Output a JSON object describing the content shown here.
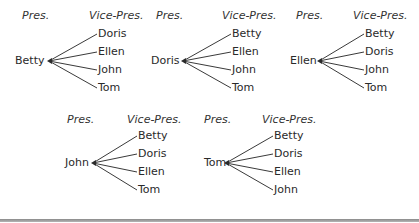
{
  "diagram": {
    "type": "tree",
    "header_left": "Pres.",
    "header_right": "Vice-Pres.",
    "trees": [
      {
        "president": "Betty",
        "vice_presidents": [
          "Doris",
          "Ellen",
          "John",
          "Tom"
        ]
      },
      {
        "president": "Doris",
        "vice_presidents": [
          "Betty",
          "Ellen",
          "John",
          "Tom"
        ]
      },
      {
        "president": "Ellen",
        "vice_presidents": [
          "Betty",
          "Doris",
          "John",
          "Tom"
        ]
      },
      {
        "president": "John",
        "vice_presidents": [
          "Betty",
          "Doris",
          "Ellen",
          "Tom"
        ]
      },
      {
        "president": "Tom",
        "vice_presidents": [
          "Betty",
          "Doris",
          "Ellen",
          "John"
        ]
      }
    ]
  }
}
